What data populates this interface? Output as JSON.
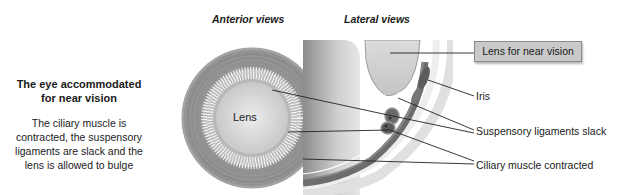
{
  "headings": {
    "anterior": "Anterior views",
    "lateral": "Lateral views"
  },
  "side_panel": {
    "title_line1": "The eye accommodated",
    "title_line2": "for near vision",
    "desc_line1": "The ciliary muscle is",
    "desc_line2": "contracted, the suspensory",
    "desc_line3": "ligaments are slack and the",
    "desc_line4": "lens is allowed to bulge"
  },
  "anterior_view": {
    "lens_label": "Lens"
  },
  "callouts": {
    "lens": "Lens for near vision",
    "iris": "Iris",
    "ligaments": "Suspensory ligaments slack",
    "muscle": "Ciliary muscle contracted"
  },
  "colors": {
    "outer_ring": "#8f8f8f",
    "ligament_band": "#a8a8a8",
    "lens_center": "#e4e4e4",
    "muscle": "#6e6e6e",
    "callout_box": "#c9c9c9"
  }
}
